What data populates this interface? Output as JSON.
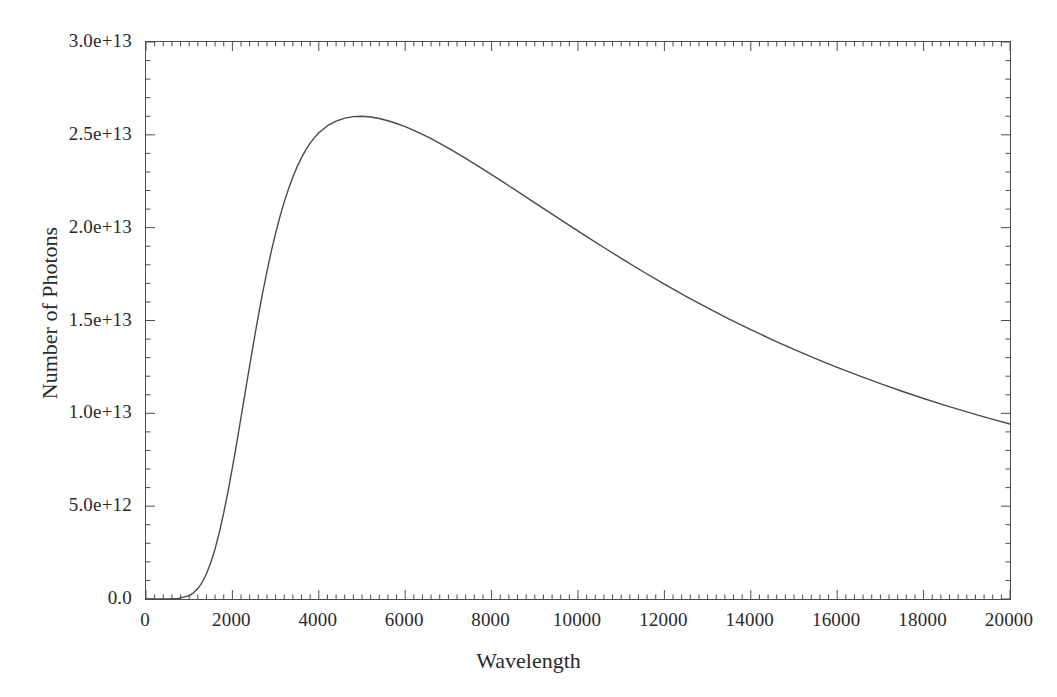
{
  "chart_data": {
    "type": "line",
    "title": "",
    "xlabel": "Wavelength",
    "ylabel": "Number of Photons",
    "xlim": [
      0,
      20000
    ],
    "ylim": [
      0,
      30000000000000.0
    ],
    "grid": false,
    "legend": null,
    "x_ticks": [
      0,
      2000,
      4000,
      6000,
      8000,
      10000,
      12000,
      14000,
      16000,
      18000,
      20000
    ],
    "x_tick_labels": [
      "0",
      "2000",
      "4000",
      "6000",
      "8000",
      "10000",
      "12000",
      "14000",
      "16000",
      "18000",
      "20000"
    ],
    "x_minor_tick_step": 200,
    "y_ticks": [
      0,
      5000000000000.0,
      10000000000000.0,
      15000000000000.0,
      20000000000000.0,
      25000000000000.0,
      30000000000000.0
    ],
    "y_tick_labels": [
      "0.0",
      "5.0e+12",
      "1.0e+13",
      "1.5e+13",
      "2.0e+13",
      "2.5e+13",
      "3.0e+13"
    ],
    "y_minor_tick_step": 1000000000000.0,
    "line_color": "#4a4a4a",
    "line_width": 1.4,
    "series": [
      {
        "name": "Photon spectral distribution",
        "x": [
          0,
          250,
          500,
          750,
          1000,
          1100,
          1200,
          1300,
          1400,
          1500,
          1600,
          1700,
          1800,
          1900,
          2000,
          2100,
          2200,
          2300,
          2400,
          2500,
          2600,
          2700,
          2800,
          2900,
          3000,
          3100,
          3200,
          3300,
          3400,
          3500,
          3600,
          3700,
          3800,
          3900,
          4000,
          4200,
          4400,
          4600,
          4800,
          5000,
          5200,
          5400,
          5600,
          5800,
          6000,
          6200,
          6400,
          6600,
          6800,
          7000,
          7400,
          7800,
          8200,
          8600,
          9000,
          9400,
          9800,
          10200,
          10600,
          11000,
          11500,
          12000,
          12500,
          13000,
          13500,
          14000,
          14500,
          15000,
          15500,
          16000,
          16500,
          17000,
          17500,
          18000,
          18500,
          19000,
          19500,
          20000
        ],
        "y": [
          0,
          0,
          2000000000,
          30000000000,
          180000000000,
          330000000000,
          560000000000,
          900000000000,
          1360000000000,
          1960000000000,
          2710000000000,
          3610000000000,
          4650000000000,
          5810000000000,
          7070000000000,
          8400000000000,
          9780000000000,
          11180000000000,
          12570000000000,
          13940000000000,
          15250000000000,
          16490000000000,
          17650000000000,
          18720000000000,
          19700000000000,
          20590000000000,
          21390000000000,
          22100000000000,
          22730000000000,
          23290000000000,
          23770000000000,
          24190000000000,
          24550000000000,
          24850000000000,
          25110000000000,
          25490000000000,
          25740000000000,
          25900000000000,
          25980000000000,
          26000000000000,
          25960000000000,
          25880000000000,
          25760000000000,
          25610000000000,
          25440000000000,
          25240000000000,
          25020000000000,
          24790000000000,
          24540000000000,
          24280000000000,
          23730000000000,
          23150000000000,
          22560000000000,
          21950000000000,
          21340000000000,
          20730000000000,
          20120000000000,
          19520000000000,
          18930000000000,
          18350000000000,
          17640000000000,
          16960000000000,
          16300000000000,
          15680000000000,
          15080000000000,
          14510000000000,
          13960000000000,
          13440000000000,
          12950000000000,
          12480000000000,
          12030000000000,
          11600000000000,
          11190000000000,
          10800000000000,
          10430000000000,
          10080000000000,
          9740000000000,
          9420000000000
        ],
        "peak_x": 5000,
        "peak_y": 26800000000000.0,
        "end_y": 1900000000000.0
      }
    ]
  },
  "axes": {
    "x_title": "Wavelength",
    "y_title": "Number of Photons"
  }
}
